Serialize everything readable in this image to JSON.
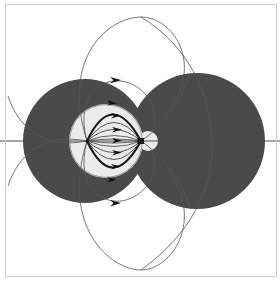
{
  "figure": {
    "background_color": "#ffffff",
    "frame": {
      "name": "plot-frame",
      "color": "#cccccc",
      "stroke_width": 1,
      "x": 5,
      "y": 4,
      "width": 271,
      "height": 272
    },
    "axis": {
      "name": "horizontal-axis",
      "color": "#4d4d4d",
      "stroke_width": 1,
      "y": 141,
      "x_start": 0,
      "x_end": 280
    },
    "colors": {
      "dark_lobe": "#4a4a4a",
      "light_lobe": "#ebebeb",
      "field_line": "#555555",
      "heavy_field_line": "#1a1a1a",
      "arrow": "#111111",
      "frame": "#cccccc",
      "background": "#ffffff"
    },
    "regions": [
      {
        "name": "left-dark-lobe",
        "shape": "circle",
        "fill": "#4a4a4a",
        "cx": 85,
        "cy": 141,
        "r": 62
      },
      {
        "name": "right-dark-lobe",
        "shape": "circle",
        "fill": "#4a4a4a",
        "cx": 197,
        "cy": 141,
        "r": 68
      },
      {
        "name": "inner-light-lobe",
        "shape": "circle",
        "fill": "#ebebeb",
        "cx": 106,
        "cy": 141,
        "r": 37
      },
      {
        "name": "small-light-lobe",
        "shape": "circle",
        "fill": "#ebebeb",
        "cx": 148,
        "cy": 141,
        "r": 10
      }
    ],
    "poles": [
      {
        "name": "left-focus",
        "x": 87,
        "y": 141
      },
      {
        "name": "right-focus",
        "x": 141,
        "y": 141
      }
    ]
  },
  "chart_data": {
    "type": "line",
    "xlabel": "",
    "ylabel": "",
    "grid": false,
    "legend": null,
    "axis_line_y": 141,
    "focus_left_x": 87,
    "focus_right_x": 141,
    "inner_field_lines": {
      "description": "Field lines joining the two foci inside the light inner lobe",
      "count": 10,
      "bulges": [
        4,
        10,
        17,
        24,
        31,
        -4,
        -10,
        -17,
        -24,
        -31
      ],
      "heavy_indices": [
        4,
        9
      ],
      "arrow_count": 5,
      "arrow_offsets": [
        -29,
        -15,
        0,
        15,
        29
      ]
    },
    "outer_field_lines": {
      "description": "Large outer loops leaving the foci and returning",
      "count": 4,
      "top_extents": [
        17,
        76
      ],
      "bottom_extents": [
        270,
        206
      ],
      "arrow_count": 4
    },
    "filled_lobes": [
      {
        "label": "left lobe",
        "cx": 85,
        "cy": 141,
        "r": 62,
        "shade": "dark"
      },
      {
        "label": "right lobe",
        "cx": 197,
        "cy": 141,
        "r": 68,
        "shade": "dark"
      },
      {
        "label": "inner lobe",
        "cx": 106,
        "cy": 141,
        "r": 37,
        "shade": "light"
      },
      {
        "label": "small lobe",
        "cx": 148,
        "cy": 141,
        "r": 10,
        "shade": "light"
      }
    ]
  }
}
